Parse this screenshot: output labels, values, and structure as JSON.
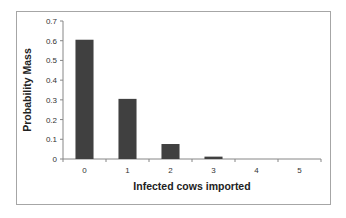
{
  "chart_data": {
    "type": "bar",
    "title": "",
    "xlabel": "Infected cows imported",
    "ylabel": "Probability Mass",
    "categories": [
      "0",
      "1",
      "2",
      "3",
      "4",
      "5"
    ],
    "values": [
      0.605,
      0.305,
      0.076,
      0.012,
      0.001,
      0.0
    ],
    "ylim": [
      0,
      0.7
    ],
    "yticks": [
      "0",
      "0.1",
      "0.2",
      "0.3",
      "0.4",
      "0.5",
      "0.6",
      "0.7"
    ],
    "grid": false,
    "legend": null,
    "bar_color": "#404040"
  }
}
